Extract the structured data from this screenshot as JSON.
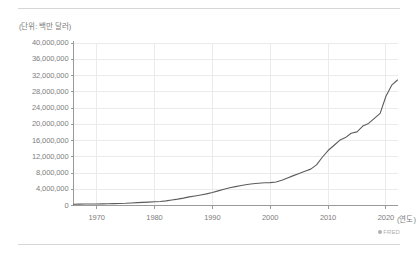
{
  "figure": {
    "unit_label": "(단위: 백만 달러)",
    "source_mark": "FRED",
    "source_icon": "circle-dot-icon",
    "divider_color": "#d6d6d6"
  },
  "chart_data": {
    "type": "line",
    "title": "",
    "subtitle": "",
    "xlabel": "(연도)",
    "ylabel": "(단위: 백만 달러)",
    "xlim": [
      1966,
      2022
    ],
    "ylim": [
      0,
      40000000
    ],
    "xticks": [
      1970,
      1980,
      1990,
      2000,
      2010,
      2020
    ],
    "xtick_labels": [
      "1970",
      "1980",
      "1990",
      "2000",
      "2010",
      "2020"
    ],
    "yticks": [
      0,
      4000000,
      8000000,
      12000000,
      16000000,
      20000000,
      24000000,
      28000000,
      32000000,
      36000000,
      40000000
    ],
    "ytick_labels": [
      "0",
      "4,000,000",
      "8,000,000",
      "12,000,000",
      "16,000,000",
      "20,000,000",
      "24,000,000",
      "28,000,000",
      "32,000,000",
      "36,000,000",
      "40,000,000"
    ],
    "grid": true,
    "grid_color": "#ebebeb",
    "axis_color": "#9a9a9a",
    "legend": null,
    "legend_position": "none",
    "series": [
      {
        "name": "",
        "color": "#5c5c5c",
        "line_width": 1.1,
        "x": [
          1966,
          1967,
          1968,
          1969,
          1970,
          1971,
          1972,
          1973,
          1974,
          1975,
          1976,
          1977,
          1978,
          1979,
          1980,
          1981,
          1982,
          1983,
          1984,
          1985,
          1986,
          1987,
          1988,
          1989,
          1990,
          1991,
          1992,
          1993,
          1994,
          1995,
          1996,
          1997,
          1998,
          1999,
          2000,
          2001,
          2002,
          2003,
          2004,
          2005,
          2006,
          2007,
          2008,
          2009,
          2010,
          2011,
          2012,
          2013,
          2014,
          2015,
          2016,
          2017,
          2018,
          2019,
          2020,
          2021,
          2022
        ],
        "y": [
          320000,
          340000,
          368000,
          366000,
          381000,
          408000,
          436000,
          466000,
          484000,
          541000,
          629000,
          706000,
          777000,
          829000,
          909000,
          995000,
          1137000,
          1372000,
          1565000,
          1817000,
          2121000,
          2346000,
          2601000,
          2868000,
          3206000,
          3598000,
          4002000,
          4351000,
          4643000,
          4921000,
          5181000,
          5369000,
          5478000,
          5606000,
          5629000,
          5770000,
          6198000,
          6760000,
          7355000,
          7905000,
          8451000,
          8951000,
          9986000,
          11876000,
          13529000,
          14764000,
          16051000,
          16719000,
          17794000,
          18120000,
          19539000,
          20205000,
          21462000,
          22669000,
          26900000,
          29617000,
          30900000
        ]
      }
    ],
    "annotations": [
      {
        "label": "2020 (연도)",
        "note": "last x tick carries the axis unit label"
      }
    ]
  }
}
